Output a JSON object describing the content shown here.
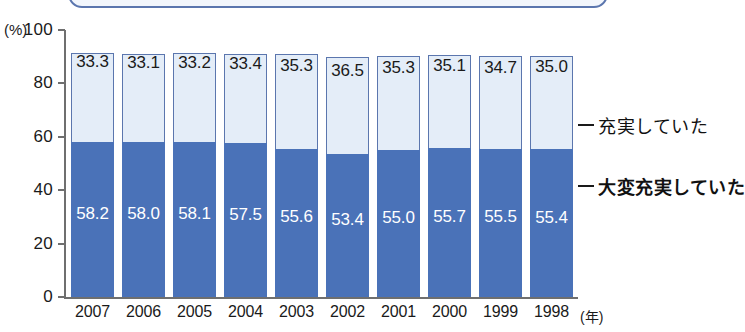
{
  "title_box": {
    "text": ""
  },
  "axes": {
    "y_unit": "(%)",
    "y_ticks": [
      "100",
      "80",
      "60",
      "40",
      "20",
      "0"
    ],
    "x_unit": "(年)"
  },
  "legend": {
    "items": [
      {
        "label": "充実していた",
        "color": "#e4edf8"
      },
      {
        "label": "大変充実していた",
        "color": "#4a72b8"
      }
    ]
  },
  "chart_data": {
    "type": "bar",
    "stacked": true,
    "title": "",
    "xlabel": "年",
    "ylabel": "%",
    "ylim": [
      0,
      100
    ],
    "yticks": [
      0,
      20,
      40,
      60,
      80,
      100
    ],
    "grid": false,
    "legend_position": "right",
    "categories": [
      "2007",
      "2006",
      "2005",
      "2004",
      "2003",
      "2002",
      "2001",
      "2000",
      "1999",
      "1998"
    ],
    "series": [
      {
        "name": "大変充実していた",
        "color": "#4a72b8",
        "values": [
          58.2,
          58.0,
          58.1,
          57.5,
          55.6,
          53.4,
          55.0,
          55.7,
          55.5,
          55.4
        ]
      },
      {
        "name": "充実していた",
        "color": "#e4edf8",
        "values": [
          33.3,
          33.1,
          33.2,
          33.4,
          35.3,
          36.5,
          35.3,
          35.1,
          34.7,
          35.0
        ]
      }
    ],
    "totals": [
      91.5,
      91.1,
      91.3,
      90.9,
      90.9,
      89.9,
      90.3,
      90.8,
      90.2,
      90.4
    ]
  }
}
